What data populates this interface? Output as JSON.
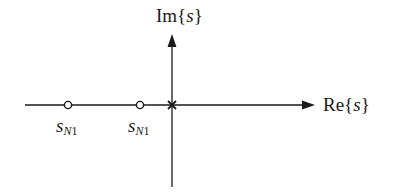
{
  "diagram": {
    "type": "pole-zero plot",
    "axes": {
      "real_label": {
        "prefix": "Re{",
        "var": "s",
        "suffix": "}"
      },
      "imag_label": {
        "prefix": "Im{",
        "var": "s",
        "suffix": "}"
      }
    },
    "zeros": [
      {
        "label_base": "s",
        "label_sub_letter": "N",
        "label_sub_num": "1",
        "marker": "circle"
      },
      {
        "label_base": "s",
        "label_sub_letter": "N",
        "label_sub_num": "1",
        "marker": "circle"
      }
    ],
    "poles": [
      {
        "marker": "cross",
        "position": "origin"
      }
    ],
    "colors": {
      "line": "#1a1a1a",
      "background": "#ffffff"
    }
  }
}
